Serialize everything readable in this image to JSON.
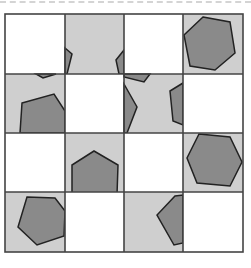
{
  "puzzle": {
    "rows": 4,
    "cols": 4,
    "colors": {
      "light_tile": "#cfcfcf",
      "white_tile": "#ffffff",
      "shape_fill": "#8a8a8a",
      "stroke": "#222222",
      "grid": "#444444"
    },
    "tiles": [
      [
        "white",
        "light",
        "white",
        "light"
      ],
      [
        "light",
        "white",
        "light",
        "white"
      ],
      [
        "white",
        "light",
        "white",
        "light"
      ],
      [
        "light",
        "white",
        "light",
        "white"
      ]
    ]
  }
}
